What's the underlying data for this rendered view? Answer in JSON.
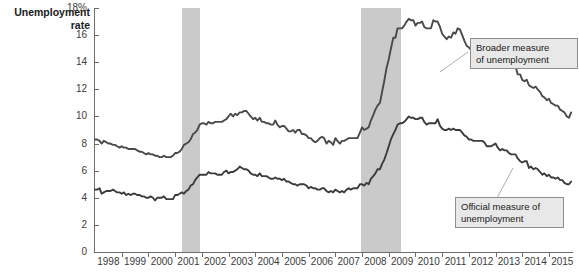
{
  "chart_data": {
    "type": "line",
    "title": "Unemployment rate",
    "xlabel": "",
    "ylabel": "Unemployment rate",
    "ylim": [
      0,
      18
    ],
    "xlim": [
      1998,
      2015.9
    ],
    "grid": false,
    "legend_position": "inline-callouts",
    "ytick_labels": [
      "0",
      "2",
      "4",
      "6",
      "8",
      "10",
      "12",
      "14",
      "16",
      "18%"
    ],
    "ytick_values": [
      0,
      2,
      4,
      6,
      8,
      10,
      12,
      14,
      16,
      18
    ],
    "xtick_labels": [
      "1998",
      "1999",
      "2000",
      "2001",
      "2002",
      "2003",
      "2004",
      "2005",
      "2006",
      "2007",
      "2008",
      "2009",
      "2010",
      "2011",
      "2012",
      "2013",
      "2014",
      "2015"
    ],
    "xtick_values": [
      1998,
      1999,
      2000,
      2001,
      2002,
      2003,
      2004,
      2005,
      2006,
      2007,
      2008,
      2009,
      2010,
      2011,
      2012,
      2013,
      2014,
      2015
    ],
    "annotations": [
      {
        "name": "broader-callout",
        "text": "Broader measure of unemployment"
      },
      {
        "name": "official-callout",
        "text": "Official measure of unemployment"
      }
    ],
    "shaded_regions": [
      {
        "name": "recession-2001",
        "x0": 2001.25,
        "x1": 2001.92,
        "color": "#cacaca"
      },
      {
        "name": "recession-2008",
        "x0": 2007.95,
        "x1": 2009.45,
        "color": "#cacaca"
      }
    ],
    "series": [
      {
        "name": "Broader measure of unemployment",
        "color": "#4a4a4a",
        "x": [
          1998.0,
          1998.08,
          1998.17,
          1998.25,
          1998.33,
          1998.42,
          1998.5,
          1998.58,
          1998.67,
          1998.75,
          1998.83,
          1998.92,
          1999.0,
          1999.08,
          1999.17,
          1999.25,
          1999.33,
          1999.42,
          1999.5,
          1999.58,
          1999.67,
          1999.75,
          1999.83,
          1999.92,
          2000.0,
          2000.08,
          2000.17,
          2000.25,
          2000.33,
          2000.42,
          2000.5,
          2000.58,
          2000.67,
          2000.75,
          2000.83,
          2000.92,
          2001.0,
          2001.08,
          2001.17,
          2001.25,
          2001.33,
          2001.42,
          2001.5,
          2001.58,
          2001.67,
          2001.75,
          2001.83,
          2001.92,
          2002.0,
          2002.08,
          2002.17,
          2002.25,
          2002.33,
          2002.42,
          2002.5,
          2002.58,
          2002.67,
          2002.75,
          2002.83,
          2002.92,
          2003.0,
          2003.08,
          2003.17,
          2003.25,
          2003.33,
          2003.42,
          2003.5,
          2003.58,
          2003.67,
          2003.75,
          2003.83,
          2003.92,
          2004.0,
          2004.08,
          2004.17,
          2004.25,
          2004.33,
          2004.42,
          2004.5,
          2004.58,
          2004.67,
          2004.75,
          2004.83,
          2004.92,
          2005.0,
          2005.08,
          2005.17,
          2005.25,
          2005.33,
          2005.42,
          2005.5,
          2005.58,
          2005.67,
          2005.75,
          2005.83,
          2005.92,
          2006.0,
          2006.08,
          2006.17,
          2006.25,
          2006.33,
          2006.42,
          2006.5,
          2006.58,
          2006.67,
          2006.75,
          2006.83,
          2006.92,
          2007.0,
          2007.08,
          2007.17,
          2007.25,
          2007.33,
          2007.42,
          2007.5,
          2007.58,
          2007.67,
          2007.75,
          2007.83,
          2007.92,
          2008.0,
          2008.08,
          2008.17,
          2008.25,
          2008.33,
          2008.42,
          2008.5,
          2008.58,
          2008.67,
          2008.75,
          2008.83,
          2008.92,
          2009.0,
          2009.08,
          2009.17,
          2009.25,
          2009.33,
          2009.42,
          2009.5,
          2009.58,
          2009.67,
          2009.75,
          2009.83,
          2009.92,
          2010.0,
          2010.08,
          2010.17,
          2010.25,
          2010.33,
          2010.42,
          2010.5,
          2010.58,
          2010.67,
          2010.75,
          2010.83,
          2010.92,
          2011.0,
          2011.08,
          2011.17,
          2011.25,
          2011.33,
          2011.42,
          2011.5,
          2011.58,
          2011.67,
          2011.75,
          2011.83,
          2011.92,
          2012.0,
          2012.08,
          2012.17,
          2012.25,
          2012.33,
          2012.42,
          2012.5,
          2012.58,
          2012.67,
          2012.75,
          2012.83,
          2012.92,
          2013.0,
          2013.08,
          2013.17,
          2013.25,
          2013.33,
          2013.42,
          2013.5,
          2013.58,
          2013.67,
          2013.75,
          2013.83,
          2013.92,
          2014.0,
          2014.08,
          2014.17,
          2014.25,
          2014.33,
          2014.42,
          2014.5,
          2014.58,
          2014.67,
          2014.75,
          2014.83,
          2014.92,
          2015.0,
          2015.08,
          2015.17,
          2015.25,
          2015.33,
          2015.42,
          2015.5,
          2015.58,
          2015.67,
          2015.75,
          2015.83
        ],
        "y": [
          8.3,
          8.3,
          8.2,
          8.0,
          8.2,
          8.1,
          8.0,
          8.0,
          7.9,
          7.9,
          7.8,
          7.7,
          7.8,
          7.7,
          7.7,
          7.6,
          7.6,
          7.6,
          7.6,
          7.5,
          7.4,
          7.4,
          7.3,
          7.2,
          7.3,
          7.2,
          7.2,
          7.1,
          7.1,
          7.0,
          7.0,
          7.1,
          7.0,
          7.0,
          7.0,
          7.1,
          7.3,
          7.3,
          7.4,
          7.6,
          7.9,
          8.0,
          8.1,
          8.3,
          8.7,
          8.8,
          9.0,
          9.4,
          9.5,
          9.5,
          9.4,
          9.6,
          9.5,
          9.5,
          9.6,
          9.6,
          9.6,
          9.6,
          9.7,
          9.8,
          10.0,
          10.2,
          10.0,
          10.2,
          10.1,
          10.3,
          10.3,
          10.4,
          10.4,
          10.2,
          10.0,
          9.8,
          9.9,
          9.7,
          9.9,
          9.6,
          9.6,
          9.5,
          9.5,
          9.4,
          9.4,
          9.7,
          9.4,
          9.2,
          9.3,
          9.3,
          9.1,
          8.9,
          8.9,
          9.0,
          8.8,
          9.0,
          9.0,
          8.7,
          8.7,
          8.6,
          8.4,
          8.4,
          8.2,
          8.1,
          8.2,
          8.4,
          8.5,
          8.4,
          8.0,
          8.2,
          8.1,
          7.9,
          8.4,
          8.2,
          8.0,
          8.2,
          8.2,
          8.3,
          8.4,
          8.4,
          8.4,
          8.4,
          8.4,
          8.8,
          9.2,
          9.0,
          9.1,
          9.2,
          9.7,
          10.1,
          10.5,
          10.8,
          11.0,
          11.8,
          12.6,
          13.6,
          14.2,
          15.0,
          15.8,
          15.8,
          16.5,
          16.5,
          16.5,
          16.7,
          17.0,
          17.2,
          17.1,
          17.1,
          16.7,
          16.9,
          16.9,
          17.0,
          16.6,
          16.5,
          16.5,
          16.5,
          17.1,
          17.0,
          17.0,
          16.6,
          16.1,
          15.9,
          15.7,
          15.9,
          15.8,
          16.2,
          16.1,
          16.5,
          16.4,
          16.0,
          15.6,
          15.2,
          15.1,
          14.9,
          14.5,
          14.5,
          14.8,
          14.8,
          14.9,
          14.7,
          14.7,
          14.4,
          14.4,
          14.4,
          14.4,
          14.3,
          13.8,
          13.9,
          13.8,
          14.3,
          14.0,
          13.6,
          13.6,
          13.7,
          13.1,
          13.1,
          12.7,
          12.6,
          12.7,
          12.3,
          12.2,
          12.1,
          12.2,
          12.0,
          11.8,
          11.5,
          11.4,
          11.2,
          11.3,
          11.0,
          10.9,
          10.8,
          10.8,
          10.5,
          10.4,
          10.3,
          10.0,
          9.9,
          10.3
        ]
      },
      {
        "name": "Official measure of unemployment",
        "color": "#3c3c3c",
        "x": [
          1998.0,
          1998.08,
          1998.17,
          1998.25,
          1998.33,
          1998.42,
          1998.5,
          1998.58,
          1998.67,
          1998.75,
          1998.83,
          1998.92,
          1999.0,
          1999.08,
          1999.17,
          1999.25,
          1999.33,
          1999.42,
          1999.5,
          1999.58,
          1999.67,
          1999.75,
          1999.83,
          1999.92,
          2000.0,
          2000.08,
          2000.17,
          2000.25,
          2000.33,
          2000.42,
          2000.5,
          2000.58,
          2000.67,
          2000.75,
          2000.83,
          2000.92,
          2001.0,
          2001.08,
          2001.17,
          2001.25,
          2001.33,
          2001.42,
          2001.5,
          2001.58,
          2001.67,
          2001.75,
          2001.83,
          2001.92,
          2002.0,
          2002.08,
          2002.17,
          2002.25,
          2002.33,
          2002.42,
          2002.5,
          2002.58,
          2002.67,
          2002.75,
          2002.83,
          2002.92,
          2003.0,
          2003.08,
          2003.17,
          2003.25,
          2003.33,
          2003.42,
          2003.5,
          2003.58,
          2003.67,
          2003.75,
          2003.83,
          2003.92,
          2004.0,
          2004.08,
          2004.17,
          2004.25,
          2004.33,
          2004.42,
          2004.5,
          2004.58,
          2004.67,
          2004.75,
          2004.83,
          2004.92,
          2005.0,
          2005.08,
          2005.17,
          2005.25,
          2005.33,
          2005.42,
          2005.5,
          2005.58,
          2005.67,
          2005.75,
          2005.83,
          2005.92,
          2006.0,
          2006.08,
          2006.17,
          2006.25,
          2006.33,
          2006.42,
          2006.5,
          2006.58,
          2006.67,
          2006.75,
          2006.83,
          2006.92,
          2007.0,
          2007.08,
          2007.17,
          2007.25,
          2007.33,
          2007.42,
          2007.5,
          2007.58,
          2007.67,
          2007.75,
          2007.83,
          2007.92,
          2008.0,
          2008.08,
          2008.17,
          2008.25,
          2008.33,
          2008.42,
          2008.5,
          2008.58,
          2008.67,
          2008.75,
          2008.83,
          2008.92,
          2009.0,
          2009.08,
          2009.17,
          2009.25,
          2009.33,
          2009.42,
          2009.5,
          2009.58,
          2009.67,
          2009.75,
          2009.83,
          2009.92,
          2010.0,
          2010.08,
          2010.17,
          2010.25,
          2010.33,
          2010.42,
          2010.5,
          2010.58,
          2010.67,
          2010.75,
          2010.83,
          2010.92,
          2011.0,
          2011.08,
          2011.17,
          2011.25,
          2011.33,
          2011.42,
          2011.5,
          2011.58,
          2011.67,
          2011.75,
          2011.83,
          2011.92,
          2012.0,
          2012.08,
          2012.17,
          2012.25,
          2012.33,
          2012.42,
          2012.5,
          2012.58,
          2012.67,
          2012.75,
          2012.83,
          2012.92,
          2013.0,
          2013.08,
          2013.17,
          2013.25,
          2013.33,
          2013.42,
          2013.5,
          2013.58,
          2013.67,
          2013.75,
          2013.83,
          2013.92,
          2014.0,
          2014.08,
          2014.17,
          2014.25,
          2014.33,
          2014.42,
          2014.5,
          2014.58,
          2014.67,
          2014.75,
          2014.83,
          2014.92,
          2015.0,
          2015.08,
          2015.17,
          2015.25,
          2015.33,
          2015.42,
          2015.5,
          2015.58,
          2015.67,
          2015.75,
          2015.83
        ],
        "y": [
          4.6,
          4.6,
          4.7,
          4.3,
          4.4,
          4.5,
          4.5,
          4.5,
          4.6,
          4.5,
          4.4,
          4.4,
          4.3,
          4.4,
          4.2,
          4.3,
          4.2,
          4.3,
          4.3,
          4.2,
          4.2,
          4.1,
          4.1,
          4.0,
          4.0,
          4.1,
          4.0,
          3.8,
          4.0,
          4.0,
          4.0,
          4.1,
          3.9,
          3.9,
          3.9,
          3.9,
          4.2,
          4.2,
          4.3,
          4.4,
          4.3,
          4.5,
          4.6,
          4.9,
          5.0,
          5.3,
          5.5,
          5.7,
          5.7,
          5.7,
          5.7,
          5.9,
          5.8,
          5.8,
          5.8,
          5.7,
          5.7,
          5.7,
          5.9,
          6.0,
          5.8,
          5.9,
          5.9,
          6.0,
          6.1,
          6.3,
          6.2,
          6.1,
          6.1,
          6.0,
          5.8,
          5.7,
          5.7,
          5.6,
          5.8,
          5.6,
          5.6,
          5.6,
          5.5,
          5.4,
          5.4,
          5.5,
          5.4,
          5.4,
          5.3,
          5.4,
          5.2,
          5.2,
          5.1,
          5.0,
          5.0,
          4.9,
          5.0,
          5.0,
          5.0,
          4.9,
          4.7,
          4.8,
          4.7,
          4.7,
          4.6,
          4.6,
          4.7,
          4.7,
          4.5,
          4.4,
          4.5,
          4.4,
          4.6,
          4.5,
          4.4,
          4.5,
          4.4,
          4.6,
          4.7,
          4.6,
          4.7,
          4.7,
          4.7,
          5.0,
          5.0,
          4.9,
          5.1,
          5.0,
          5.4,
          5.6,
          5.8,
          6.1,
          6.1,
          6.5,
          6.8,
          7.3,
          7.8,
          8.3,
          8.7,
          9.0,
          9.4,
          9.5,
          9.5,
          9.6,
          9.8,
          10.0,
          9.9,
          9.9,
          9.8,
          9.8,
          9.9,
          9.9,
          9.6,
          9.4,
          9.5,
          9.5,
          9.5,
          9.5,
          9.8,
          9.3,
          9.1,
          9.0,
          9.0,
          9.1,
          9.0,
          9.1,
          9.0,
          9.0,
          9.0,
          8.8,
          8.6,
          8.5,
          8.3,
          8.3,
          8.2,
          8.2,
          8.2,
          8.2,
          8.2,
          8.1,
          7.8,
          7.8,
          7.8,
          7.9,
          8.0,
          7.7,
          7.5,
          7.6,
          7.5,
          7.5,
          7.3,
          7.2,
          7.2,
          7.2,
          6.9,
          6.7,
          6.6,
          6.7,
          6.7,
          6.2,
          6.3,
          6.1,
          6.2,
          6.1,
          5.9,
          5.7,
          5.8,
          5.6,
          5.7,
          5.5,
          5.5,
          5.4,
          5.5,
          5.3,
          5.3,
          5.1,
          5.0,
          5.0,
          5.2
        ]
      }
    ]
  },
  "callouts": {
    "broader": {
      "line1": "Broader measure",
      "line2": "of unemployment"
    },
    "official": {
      "line1": "Official measure of",
      "line2": "unemployment"
    }
  }
}
